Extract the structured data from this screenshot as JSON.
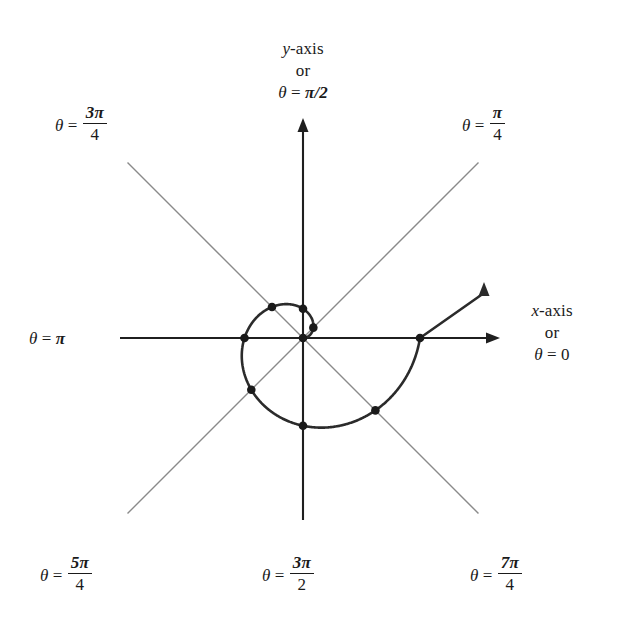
{
  "figure": {
    "kind": "polar-archimedean-spiral",
    "background": "#ffffff",
    "width": 625,
    "height": 617
  },
  "colors": {
    "ink": "#1a1a1a",
    "axis": "#1f1f1f",
    "curve": "#2b2b2b",
    "ray": "#8a8a8a",
    "dot": "#1a1a1a"
  },
  "axis_labels": {
    "top": {
      "line1_var": "y",
      "line1_rest": "-axis",
      "line2": "or",
      "line3_theta": "θ",
      "line3_eq": " = ",
      "line3_val": "π/2"
    },
    "right": {
      "line1_var": "x",
      "line1_rest": "-axis",
      "line2": "or",
      "line3_theta": "θ",
      "line3_eq": " = ",
      "line3_val": "0"
    },
    "left": {
      "theta": "θ",
      "eq": " = ",
      "val": "π"
    }
  },
  "ray_labels": [
    {
      "id": "pi-4",
      "theta": "θ",
      "eq": "=",
      "num": "π",
      "den": "4",
      "angle_deg": 45,
      "x": 462,
      "y": 103
    },
    {
      "id": "3pi-4",
      "theta": "θ",
      "eq": "=",
      "num": "3π",
      "den": "4",
      "angle_deg": 135,
      "x": 55,
      "y": 103
    },
    {
      "id": "5pi-4",
      "theta": "θ",
      "eq": "=",
      "num": "5π",
      "den": "4",
      "angle_deg": 225,
      "x": 40,
      "y": 553
    },
    {
      "id": "3pi-2",
      "theta": "θ",
      "eq": "=",
      "num": "3π",
      "den": "2",
      "angle_deg": 270,
      "x": 262,
      "y": 553
    },
    {
      "id": "7pi-4",
      "theta": "θ",
      "eq": "=",
      "num": "7π",
      "den": "4",
      "angle_deg": 315,
      "x": 470,
      "y": 553
    }
  ],
  "chart_data": {
    "type": "line",
    "title": "",
    "xlabel": "x-axis or θ = 0",
    "ylabel": "y-axis or θ = π/2",
    "coordinate_system": "polar",
    "equation": "r = aθ",
    "origin_px": {
      "x": 303,
      "y": 338
    },
    "pixels_per_radian": 18.62,
    "theta_start": 0,
    "theta_end": 6.2832,
    "grid": false,
    "legend": false,
    "rays_deg": [
      0,
      45,
      90,
      135,
      180,
      225,
      270,
      315
    ],
    "axis_extent_px": {
      "x_min": 120,
      "x_max": 500,
      "y_min": 118,
      "y_max": 520
    },
    "marked_points": [
      {
        "theta_rad": 0.7854,
        "theta_label": "π/4",
        "r_px": 14.6,
        "turn": 1
      },
      {
        "theta_rad": 1.5708,
        "theta_label": "π/2",
        "r_px": 29.2,
        "turn": 1
      },
      {
        "theta_rad": 2.3562,
        "theta_label": "3π/4",
        "r_px": 43.9,
        "turn": 1
      },
      {
        "theta_rad": 3.1416,
        "theta_label": "π",
        "r_px": 58.5,
        "turn": 1
      },
      {
        "theta_rad": 3.927,
        "theta_label": "5π/4",
        "r_px": 73.1,
        "turn": 1
      },
      {
        "theta_rad": 4.7124,
        "theta_label": "3π/2",
        "r_px": 87.7,
        "turn": 1
      },
      {
        "theta_rad": 5.4978,
        "theta_label": "7π/4",
        "r_px": 102.4,
        "turn": 1
      },
      {
        "theta_rad": 6.2832,
        "theta_label": "2π",
        "r_px": 117.0,
        "turn": 1
      }
    ],
    "inner_marked_points": [
      {
        "theta_rad": 0.7854,
        "r_px": 14.6
      },
      {
        "theta_rad": 1.5708,
        "r_px": 29.2
      },
      {
        "theta_rad": 2.3562,
        "r_px": 43.9
      },
      {
        "theta_rad": 3.1416,
        "r_px": 58.5
      }
    ],
    "origin_marked": true,
    "terminal_arrow": {
      "at_theta_rad": 6.2832,
      "direction": "up",
      "tip_px": {
        "x": 484,
        "y": 282
      }
    },
    "axis_arrows": [
      "up",
      "right"
    ]
  }
}
